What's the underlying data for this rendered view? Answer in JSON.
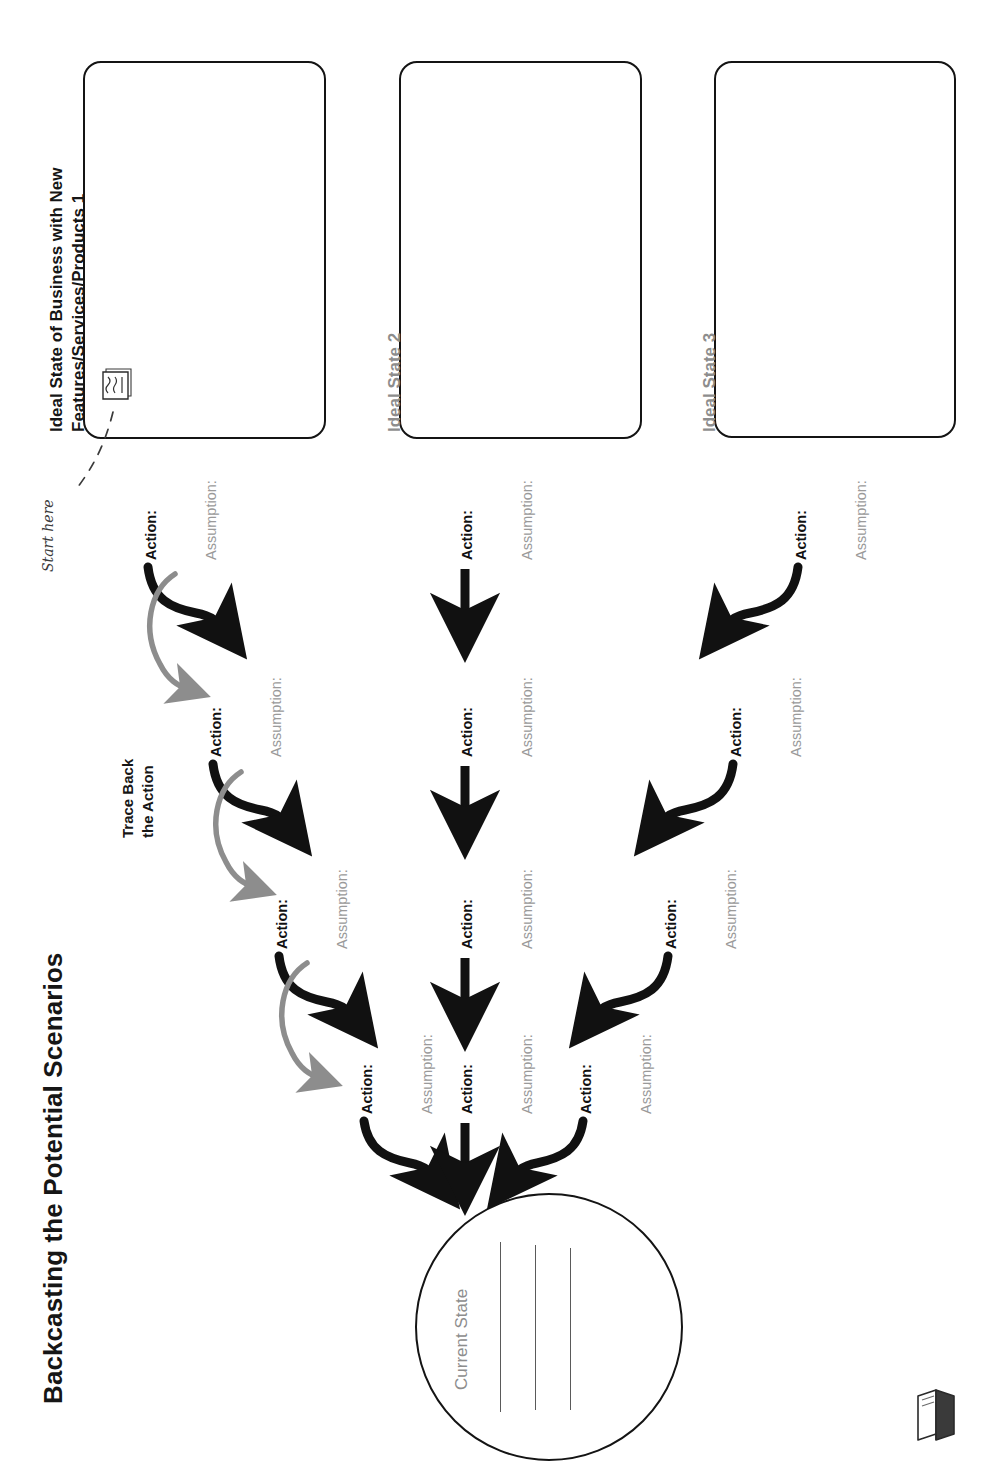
{
  "page": {
    "title": "Backcasting the Potential Scenarios",
    "orientation": "rotated-90-ccw",
    "background": "#ffffff",
    "logo_name": "book-logo"
  },
  "legend": {
    "start_here": "Start here",
    "trace_back_line1": "Trace Back",
    "trace_back_line2": "the Action",
    "sticky_note_icon": "sticky-note-icon"
  },
  "colors": {
    "ink": "#141414",
    "muted": "#9a9a9a",
    "trace_arrow": "#8d8d8d",
    "flow_arrow": "#111111",
    "rule_line": "#5a5a5a"
  },
  "ideal_states": [
    {
      "id": 1,
      "label": "Ideal State of Business with New\nFeatures/Services/Products 1",
      "label_style": "dark"
    },
    {
      "id": 2,
      "label": "Ideal State 2",
      "label_style": "gray"
    },
    {
      "id": 3,
      "label": "Ideal State 3",
      "label_style": "gray"
    }
  ],
  "current_state": {
    "label": "Current State",
    "rule_count": 3
  },
  "labels": {
    "action": "Action:",
    "assumption": "Assumption:"
  },
  "columns": [
    {
      "id": 1,
      "ideal_state": 1,
      "steps": 4,
      "arrow_style": "curve-right"
    },
    {
      "id": 2,
      "ideal_state": 2,
      "steps": 4,
      "arrow_style": "straight"
    },
    {
      "id": 3,
      "ideal_state": 3,
      "steps": 4,
      "arrow_style": "curve-left"
    }
  ],
  "steps": [
    {
      "col": 1,
      "row": 1,
      "action": "Action:",
      "assumption": "Assumption:"
    },
    {
      "col": 1,
      "row": 2,
      "action": "Action:",
      "assumption": "Assumption:"
    },
    {
      "col": 1,
      "row": 3,
      "action": "Action:",
      "assumption": "Assumption:"
    },
    {
      "col": 1,
      "row": 4,
      "action": "Action:",
      "assumption": "Assumption:"
    },
    {
      "col": 2,
      "row": 1,
      "action": "Action:",
      "assumption": "Assumption:"
    },
    {
      "col": 2,
      "row": 2,
      "action": "Action:",
      "assumption": "Assumption:"
    },
    {
      "col": 2,
      "row": 3,
      "action": "Action:",
      "assumption": "Assumption:"
    },
    {
      "col": 2,
      "row": 4,
      "action": "Action:",
      "assumption": "Assumption:"
    },
    {
      "col": 3,
      "row": 1,
      "action": "Action:",
      "assumption": "Assumption:"
    },
    {
      "col": 3,
      "row": 2,
      "action": "Action:",
      "assumption": "Assumption:"
    },
    {
      "col": 3,
      "row": 3,
      "action": "Action:",
      "assumption": "Assumption:"
    },
    {
      "col": 3,
      "row": 4,
      "action": "Action:",
      "assumption": "Assumption:"
    }
  ]
}
